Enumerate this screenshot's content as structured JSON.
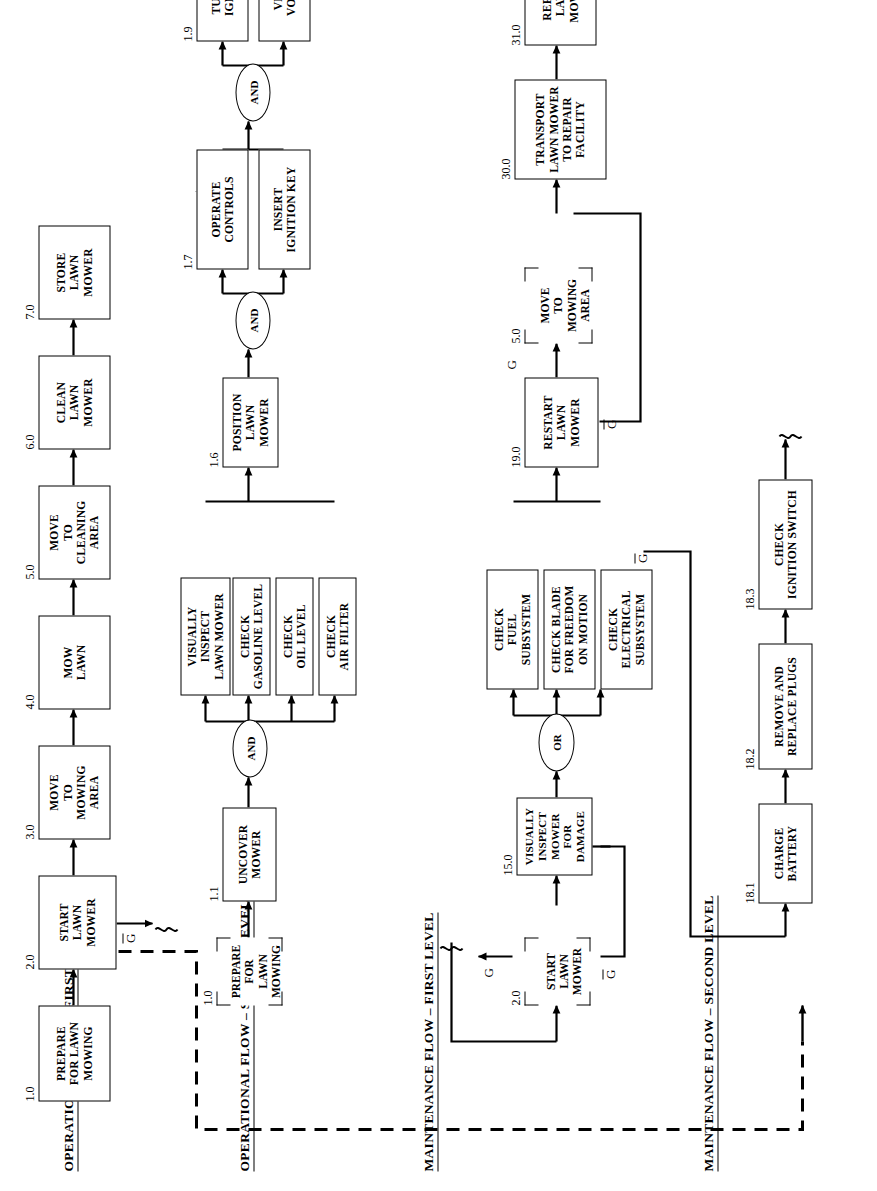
{
  "diagram": {
    "sections": {
      "op1": "OPERATIONAL FLOW – FIRST LEVEL",
      "op2": "OPERATIONAL FLOW – SECOND LEVEL",
      "mt1": "MAINTENANCE FLOW – FIRST LEVEL",
      "mt2": "MAINTENANCE FLOW – SECOND LEVEL"
    },
    "labels": {
      "ref": "REF",
      "and": "AND",
      "or": "OR",
      "g": "G",
      "gbar": "G"
    },
    "blocks": {
      "op1": [
        {
          "id": "1.0",
          "text": "PREPARE\nFOR LAWN\nMOWING",
          "kind": "box"
        },
        {
          "id": "2.0",
          "text": "START\nLAWN\nMOWER",
          "kind": "box"
        },
        {
          "id": "3.0",
          "text": "MOVE\nTO\nMOWING\nAREA",
          "kind": "box"
        },
        {
          "id": "4.0",
          "text": "MOW\nLAWN",
          "kind": "box"
        },
        {
          "id": "5.0",
          "text": "MOVE\nTO\nCLEANING\nAREA",
          "kind": "box"
        },
        {
          "id": "6.0",
          "text": "CLEAN\nLAWN\nMOWER",
          "kind": "box"
        },
        {
          "id": "7.0",
          "text": "STORE\nLAWN\nMOWER",
          "kind": "box"
        }
      ],
      "op2": [
        {
          "id": "1.0",
          "text": "PREPARE FOR\nLAWN\nMOWING",
          "kind": "ref"
        },
        {
          "id": "1.1",
          "text": "UNCOVER\nMOWER",
          "kind": "box"
        },
        {
          "id": "1.2",
          "text": "VISUALLY\nINSPECT\nLAWN MOWER",
          "kind": "box"
        },
        {
          "id": "1.3",
          "text": "CHECK\nGASOLINE LEVEL",
          "kind": "box"
        },
        {
          "id": "1.4",
          "text": "CHECK\nOIL LEVEL",
          "kind": "box"
        },
        {
          "id": "1.5",
          "text": "CHECK\nAIR FILTER",
          "kind": "box"
        },
        {
          "id": "1.6",
          "text": "POSITION\nLAWN\nMOWER",
          "kind": "box"
        },
        {
          "id": "1.7",
          "text": "OPERATE\nCONTROLS",
          "kind": "box"
        },
        {
          "id": "1.8",
          "text": "INSERT\nIGNITION KEY",
          "kind": "box"
        },
        {
          "id": "1.9",
          "text": "TURN ON\nIGNITION",
          "kind": "box"
        },
        {
          "id": "1.10",
          "text": "VERIFY\nVOLTAGE",
          "kind": "box"
        },
        {
          "id": "2.0",
          "text": "START\nLAWN\nMOWER",
          "kind": "ref"
        }
      ],
      "mt1": [
        {
          "id": "2.0",
          "text": "START\nLAWN\nMOWER",
          "kind": "ref"
        },
        {
          "id": "15.0",
          "text": "VISUALLY\nINSPECT\nMOWER\nFOR\nDAMAGE",
          "kind": "box"
        },
        {
          "id": "16.0",
          "text": "CHECK\nFUEL\nSUBSYSTEM",
          "kind": "box"
        },
        {
          "id": "17.0",
          "text": "CHECK BLADE\nFOR FREEDOM\nON MOTION",
          "kind": "box"
        },
        {
          "id": "18.0",
          "text": "CHECK\nELECTRICAL\nSUBSYSTEM",
          "kind": "box"
        },
        {
          "id": "19.0",
          "text": "RESTART\nLAWN\nMOWER",
          "kind": "box"
        },
        {
          "id": "5.0",
          "text": "MOVE\nTO\nMOWING\nAREA",
          "kind": "ref"
        },
        {
          "id": "30.0",
          "text": "TRANSPORT\nLAWN MOWER\nTO REPAIR\nFACILITY",
          "kind": "box"
        },
        {
          "id": "31.0",
          "text": "REPAIR\nLAWN\nMOWER",
          "kind": "box"
        }
      ],
      "mt2": [
        {
          "id": "18.1",
          "text": "CHARGE\nBATTERY",
          "kind": "box"
        },
        {
          "id": "18.2",
          "text": "REMOVE AND\nREPLACE PLUGS",
          "kind": "box"
        },
        {
          "id": "18.3",
          "text": "CHECK\nIGNITION SWITCH",
          "kind": "box"
        }
      ]
    },
    "colors": {
      "line": "#000000",
      "background": "#ffffff",
      "text": "#000000"
    }
  }
}
